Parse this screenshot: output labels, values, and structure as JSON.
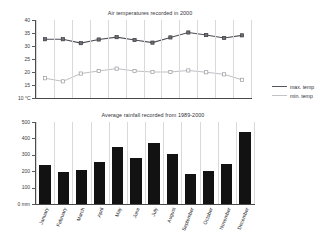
{
  "chart_data": [
    {
      "type": "line",
      "title": "Air temperatures recorded in 2000",
      "xlabel": "",
      "ylabel": "°C",
      "categories": [
        "January",
        "February",
        "March",
        "April",
        "May",
        "June",
        "July",
        "August",
        "September",
        "October",
        "November",
        "December"
      ],
      "yticks": [
        "40",
        "35",
        "30",
        "25",
        "20",
        "15",
        "10 °C"
      ],
      "ytick_values": [
        40,
        35,
        30,
        25,
        20,
        15,
        10
      ],
      "ylim": [
        10,
        40
      ],
      "grid": "vertical",
      "legend_position": "right",
      "series": [
        {
          "name": "max. temp",
          "color": "#4f4f57",
          "marker": "filled-square",
          "values": [
            32.6,
            32.6,
            31.1,
            32.5,
            33.4,
            32.3,
            31.3,
            33.3,
            35.2,
            34.2,
            33.1,
            34.1
          ]
        },
        {
          "name": "min. temp",
          "color": "#bfbfc4",
          "marker": "open-square",
          "values": [
            17.6,
            16.4,
            19.4,
            20.4,
            21.3,
            20.4,
            20.0,
            20.0,
            20.6,
            19.9,
            19.1,
            17.0
          ]
        }
      ]
    },
    {
      "type": "bar",
      "title": "Average rainfall recorded from 1989-2000",
      "xlabel": "",
      "ylabel": "mm",
      "categories": [
        "January",
        "February",
        "March",
        "April",
        "May",
        "June",
        "July",
        "August",
        "September",
        "October",
        "November",
        "December"
      ],
      "values": [
        240,
        193,
        208,
        255,
        350,
        278,
        370,
        308,
        183,
        200,
        247,
        440
      ],
      "yticks": [
        "500",
        "400",
        "300",
        "200",
        "100",
        "0 mm"
      ],
      "ytick_values": [
        500,
        400,
        300,
        200,
        100,
        0
      ],
      "ylim": [
        0,
        500
      ],
      "grid": "vertical",
      "bar_color": "#121212"
    }
  ],
  "temp_chart": {
    "title": "Air temperatures recorded in 2000",
    "yticks": [
      "40",
      "35",
      "30",
      "25",
      "20",
      "15",
      "10 °C"
    ]
  },
  "rain_chart": {
    "title": "Average rainfall recorded from 1989-2000",
    "yticks": [
      "500",
      "400",
      "300",
      "200",
      "100",
      "0 mm"
    ]
  },
  "legend": {
    "items": [
      {
        "label": "max. temp",
        "color": "#55555c"
      },
      {
        "label": "min. temp",
        "color": "#c2c2c7"
      }
    ]
  }
}
